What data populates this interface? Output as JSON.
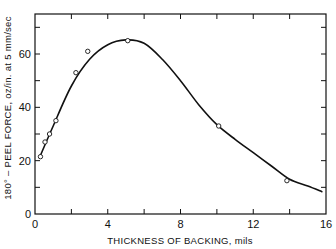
{
  "chart_data": {
    "type": "line",
    "title": "",
    "xlabel": "THICKNESS OF BACKING, mils",
    "ylabel": "180° – PEEL FORCE, oz/in. at 5 mm/sec",
    "xlim": [
      0,
      16
    ],
    "ylim": [
      0,
      75
    ],
    "x_ticks": [
      0,
      4,
      8,
      12,
      16
    ],
    "x_minor_ticks": [
      2,
      6,
      10,
      14
    ],
    "y_ticks": [
      0,
      20,
      40,
      60
    ],
    "y_minor_ticks": [
      10,
      30,
      50,
      70
    ],
    "grid": false,
    "legend": null,
    "series": [
      {
        "name": "measured",
        "style": "open-circle-markers",
        "x": [
          0.3,
          0.55,
          0.8,
          1.15,
          2.25,
          2.9,
          5.1,
          10.1,
          13.85
        ],
        "y": [
          21.5,
          27,
          30,
          35,
          53,
          61,
          65,
          33,
          12.5
        ]
      },
      {
        "name": "fitted-curve",
        "style": "smooth-line",
        "x": [
          0.3,
          1,
          2,
          3,
          4,
          5,
          6,
          7,
          8,
          9,
          10,
          11,
          12,
          13,
          14,
          15,
          15.8
        ],
        "y": [
          22,
          33,
          48,
          58,
          63.5,
          65.3,
          64,
          58,
          50,
          41,
          33.5,
          28,
          23,
          18,
          13,
          10.5,
          8.3
        ]
      }
    ]
  },
  "axes": {
    "x_title": "THICKNESS OF BACKING, mils",
    "y_title": "180° – PEEL FORCE, oz/in. at 5 mm/sec",
    "x_tick_labels": [
      "0",
      "4",
      "8",
      "12",
      "16"
    ],
    "y_tick_labels": [
      "0",
      "20",
      "40",
      "60"
    ]
  },
  "colors": {
    "line": "#111111",
    "background": "#ffffff"
  }
}
